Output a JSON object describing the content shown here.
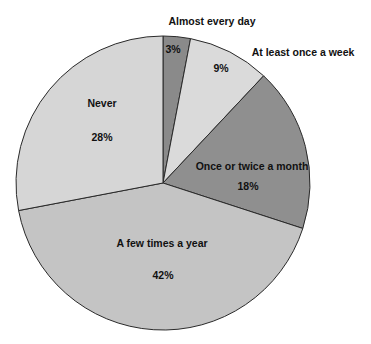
{
  "chart_data": {
    "type": "pie",
    "title": "",
    "start_angle_deg": -90,
    "direction": "clockwise",
    "categories": [
      "Almost every day",
      "At least once a week",
      "Once or twice a month",
      "A few times a year",
      "Never"
    ],
    "values": [
      3,
      9,
      18,
      42,
      28
    ],
    "value_labels": [
      "3%",
      "9%",
      "18%",
      "42%",
      "28%"
    ],
    "colors": [
      "#8a8a8a",
      "#dadada",
      "#8f8f8f",
      "#c4c4c4",
      "#d6d6d6"
    ],
    "edge_color": "#2a2a2a",
    "center": [
      163,
      183
    ],
    "radius": 147,
    "labels": [
      {
        "name": "Almost every day",
        "x": 212,
        "y": 25,
        "pct": "3%",
        "px": 173,
        "py": 53
      },
      {
        "name": "At least once a week",
        "x": 303,
        "y": 56,
        "pct": "9%",
        "px": 221,
        "py": 72
      },
      {
        "name": "Once or twice a month",
        "x": 252,
        "y": 170,
        "pct": "18%",
        "px": 248,
        "py": 190
      },
      {
        "name": "A few times a year",
        "x": 162,
        "y": 247,
        "pct": "42%",
        "px": 163,
        "py": 279
      },
      {
        "name": "Never",
        "x": 102,
        "y": 107,
        "pct": "28%",
        "px": 102,
        "py": 141
      }
    ],
    "legend": "none"
  }
}
